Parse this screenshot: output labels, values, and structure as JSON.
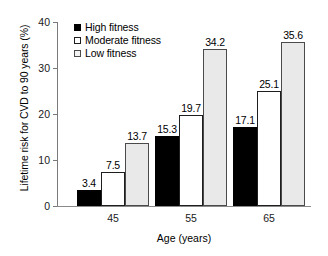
{
  "chart_data": {
    "type": "bar",
    "title": "",
    "subtitle": "",
    "xlabel": "Age (years)",
    "ylabel": "Lifetime risk for CVD to 90 years (%)",
    "categories": [
      "45",
      "55",
      "65"
    ],
    "series": [
      {
        "name": "High fitness",
        "color": "#000000",
        "values": [
          3.4,
          15.3,
          17.1
        ],
        "labels": [
          "3.4",
          "15.3",
          "17.1"
        ]
      },
      {
        "name": "Moderate fitness",
        "color": "#ffffff",
        "values": [
          7.5,
          19.7,
          25.1
        ],
        "labels": [
          "7.5",
          "19.7",
          "25.1"
        ]
      },
      {
        "name": "Low fitness",
        "color": "#e9e9e9",
        "values": [
          13.7,
          34.2,
          35.6
        ],
        "labels": [
          "13.7",
          "34.2",
          "35.6"
        ]
      }
    ],
    "ylim": [
      0,
      40
    ],
    "yticks": [
      0,
      10,
      20,
      30,
      40
    ],
    "ytick_labels": [
      "0",
      "10",
      "20",
      "30",
      "40"
    ],
    "grid": false,
    "legend_position": "top-left-inside",
    "legend_entries": [
      "High fitness",
      "Moderate fitness",
      "Low fitness"
    ]
  }
}
